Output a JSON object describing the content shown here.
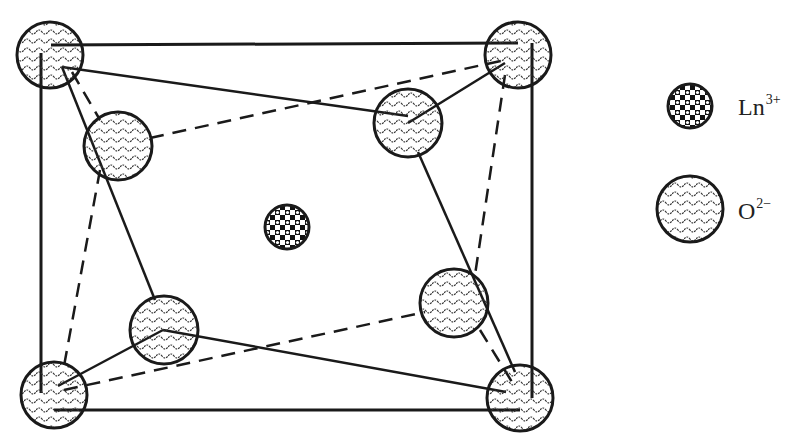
{
  "figure": {
    "colors": {
      "stroke": "#1a1a1a",
      "background": "#ffffff",
      "ion_fill": "#ffffff"
    }
  },
  "legend": {
    "items": [
      {
        "symbol": "Ln",
        "charge": "3+",
        "pattern": "checkered-dots"
      },
      {
        "symbol": "O",
        "charge": "2−",
        "pattern": "wavy-lines"
      }
    ]
  }
}
